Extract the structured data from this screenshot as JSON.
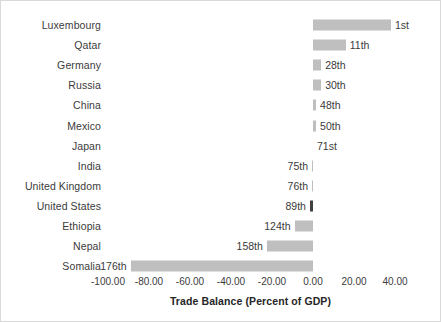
{
  "chart_data": {
    "type": "bar",
    "orientation": "horizontal",
    "title": "",
    "xlabel": "Trade Balance (Percent of GDP)",
    "ylabel": "",
    "xlim": [
      -110,
      48
    ],
    "xticks": [
      "-100.00",
      "-80.00",
      "-60.00",
      "-40.00",
      "-20.00",
      "0.00",
      "20.00",
      "40.00"
    ],
    "xtick_values": [
      -100,
      -80,
      -60,
      -40,
      -20,
      0,
      20,
      40
    ],
    "grid": false,
    "legend": false,
    "zero_line_value": 0,
    "bar_color": "#bfbfbf",
    "highlight_color": "#404040",
    "categories": [
      "Luxembourg",
      "Qatar",
      "Germany",
      "Russia",
      "China",
      "Mexico",
      "Japan",
      "India",
      "United Kingdom",
      "United States",
      "Ethiopia",
      "Nepal",
      "Somalia"
    ],
    "values": [
      38.0,
      16.0,
      4.0,
      4.0,
      1.5,
      1.5,
      0.0,
      -0.5,
      -0.5,
      -1.5,
      -9.0,
      -22.5,
      -89.0
    ],
    "data_labels": [
      "1st",
      "11th",
      "28th",
      "30th",
      "48th",
      "50th",
      "71st",
      "75th",
      "76th",
      "89th",
      "124th",
      "158th",
      "176th"
    ],
    "highlighted_category": "United States",
    "bars": [
      {
        "category": "Luxembourg",
        "value": 38.0,
        "rank_label": "1st",
        "highlight": false
      },
      {
        "category": "Qatar",
        "value": 16.0,
        "rank_label": "11th",
        "highlight": false
      },
      {
        "category": "Germany",
        "value": 4.0,
        "rank_label": "28th",
        "highlight": false
      },
      {
        "category": "Russia",
        "value": 4.0,
        "rank_label": "30th",
        "highlight": false
      },
      {
        "category": "China",
        "value": 1.5,
        "rank_label": "48th",
        "highlight": false
      },
      {
        "category": "Mexico",
        "value": 1.5,
        "rank_label": "50th",
        "highlight": false
      },
      {
        "category": "Japan",
        "value": 0.0,
        "rank_label": "71st",
        "highlight": false
      },
      {
        "category": "India",
        "value": -0.5,
        "rank_label": "75th",
        "highlight": false
      },
      {
        "category": "United Kingdom",
        "value": -0.5,
        "rank_label": "76th",
        "highlight": false
      },
      {
        "category": "United States",
        "value": -1.5,
        "rank_label": "89th",
        "highlight": true
      },
      {
        "category": "Ethiopia",
        "value": -9.0,
        "rank_label": "124th",
        "highlight": false
      },
      {
        "category": "Nepal",
        "value": -22.5,
        "rank_label": "158th",
        "highlight": false
      },
      {
        "category": "Somalia",
        "value": -89.0,
        "rank_label": "176th",
        "highlight": false
      }
    ]
  }
}
